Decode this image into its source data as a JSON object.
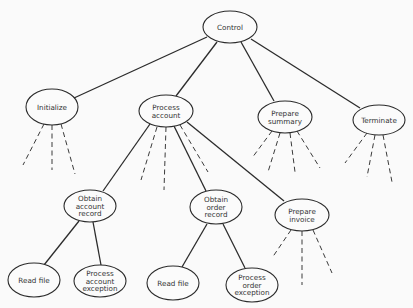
{
  "diagram": {
    "nodes": [
      {
        "id": "control",
        "lines": [
          "Control"
        ],
        "cx": 230,
        "cy": 27,
        "rx": 27,
        "ry": 16
      },
      {
        "id": "initialize",
        "lines": [
          "Initialize"
        ],
        "cx": 52,
        "cy": 107,
        "rx": 26,
        "ry": 18
      },
      {
        "id": "process-account",
        "lines": [
          "Process",
          "account"
        ],
        "cx": 166,
        "cy": 111,
        "rx": 27,
        "ry": 16
      },
      {
        "id": "prepare-summary",
        "lines": [
          "Prepare",
          "summary"
        ],
        "cx": 285,
        "cy": 117,
        "rx": 27,
        "ry": 16
      },
      {
        "id": "terminate",
        "lines": [
          "Terminate"
        ],
        "cx": 379,
        "cy": 120,
        "rx": 26,
        "ry": 15
      },
      {
        "id": "obtain-account-record",
        "lines": [
          "Obtain",
          "account",
          "record"
        ],
        "cx": 90,
        "cy": 206,
        "rx": 26,
        "ry": 16
      },
      {
        "id": "obtain-order-record",
        "lines": [
          "Obtain",
          "order",
          "record"
        ],
        "cx": 216,
        "cy": 207,
        "rx": 26,
        "ry": 17
      },
      {
        "id": "prepare-invoice",
        "lines": [
          "Prepare",
          "invoice"
        ],
        "cx": 302,
        "cy": 215,
        "rx": 27,
        "ry": 16
      },
      {
        "id": "read-file-1",
        "lines": [
          "Read file"
        ],
        "cx": 34,
        "cy": 280,
        "rx": 26,
        "ry": 17
      },
      {
        "id": "process-account-exception",
        "lines": [
          "Process",
          "account",
          "exception"
        ],
        "cx": 100,
        "cy": 281,
        "rx": 26,
        "ry": 16
      },
      {
        "id": "read-file-2",
        "lines": [
          "Read file"
        ],
        "cx": 173,
        "cy": 283,
        "rx": 26,
        "ry": 17
      },
      {
        "id": "process-order-exception",
        "lines": [
          "Process",
          "order",
          "exception"
        ],
        "cx": 252,
        "cy": 285,
        "rx": 26,
        "ry": 17
      }
    ],
    "edges": [
      {
        "from": "control",
        "to": "initialize",
        "style": "solid",
        "x1": 207,
        "y1": 37,
        "x2": 74,
        "y2": 98
      },
      {
        "from": "control",
        "to": "process-account",
        "style": "solid",
        "x1": 217,
        "y1": 42,
        "x2": 176,
        "y2": 96
      },
      {
        "from": "control",
        "to": "prepare-summary",
        "style": "solid",
        "x1": 241,
        "y1": 42,
        "x2": 274,
        "y2": 101
      },
      {
        "from": "control",
        "to": "terminate",
        "style": "solid",
        "x1": 251,
        "y1": 39,
        "x2": 360,
        "y2": 108
      },
      {
        "from": "process-account",
        "to": "obtain-account-record",
        "style": "solid",
        "x1": 150,
        "y1": 124,
        "x2": 103,
        "y2": 191
      },
      {
        "from": "process-account",
        "to": "obtain-order-record",
        "style": "solid",
        "x1": 174,
        "y1": 126,
        "x2": 206,
        "y2": 191
      },
      {
        "from": "process-account",
        "to": "prepare-invoice",
        "style": "solid",
        "x1": 187,
        "y1": 122,
        "x2": 284,
        "y2": 201
      },
      {
        "from": "obtain-account-record",
        "to": "read-file-1",
        "style": "solid",
        "x1": 79,
        "y1": 221,
        "x2": 44,
        "y2": 265
      },
      {
        "from": "obtain-account-record",
        "to": "process-account-exception",
        "style": "solid",
        "x1": 93,
        "y1": 222,
        "x2": 101,
        "y2": 265
      },
      {
        "from": "obtain-order-record",
        "to": "read-file-2",
        "style": "solid",
        "x1": 207,
        "y1": 224,
        "x2": 182,
        "y2": 267
      },
      {
        "from": "obtain-order-record",
        "to": "process-order-exception",
        "style": "solid",
        "x1": 223,
        "y1": 224,
        "x2": 245,
        "y2": 268
      },
      {
        "from": "initialize",
        "to": "",
        "style": "dashed",
        "x1": 44,
        "y1": 124,
        "x2": 23,
        "y2": 165
      },
      {
        "from": "initialize",
        "to": "",
        "style": "dashed",
        "x1": 52,
        "y1": 125,
        "x2": 52,
        "y2": 170
      },
      {
        "from": "initialize",
        "to": "",
        "style": "dashed",
        "x1": 61,
        "y1": 124,
        "x2": 75,
        "y2": 174
      },
      {
        "from": "process-account",
        "to": "",
        "style": "dashed",
        "x1": 157,
        "y1": 127,
        "x2": 141,
        "y2": 180
      },
      {
        "from": "process-account",
        "to": "",
        "style": "dashed",
        "x1": 166,
        "y1": 127,
        "x2": 164,
        "y2": 190
      },
      {
        "from": "process-account",
        "to": "",
        "style": "dashed",
        "x1": 180,
        "y1": 125,
        "x2": 208,
        "y2": 172
      },
      {
        "from": "prepare-summary",
        "to": "",
        "style": "dashed",
        "x1": 272,
        "y1": 131,
        "x2": 252,
        "y2": 158
      },
      {
        "from": "prepare-summary",
        "to": "",
        "style": "dashed",
        "x1": 280,
        "y1": 133,
        "x2": 268,
        "y2": 172
      },
      {
        "from": "prepare-summary",
        "to": "",
        "style": "dashed",
        "x1": 290,
        "y1": 133,
        "x2": 295,
        "y2": 172
      },
      {
        "from": "prepare-summary",
        "to": "",
        "style": "dashed",
        "x1": 297,
        "y1": 131,
        "x2": 320,
        "y2": 168
      },
      {
        "from": "terminate",
        "to": "",
        "style": "dashed",
        "x1": 367,
        "y1": 133,
        "x2": 345,
        "y2": 163
      },
      {
        "from": "terminate",
        "to": "",
        "style": "dashed",
        "x1": 375,
        "y1": 135,
        "x2": 367,
        "y2": 177
      },
      {
        "from": "terminate",
        "to": "",
        "style": "dashed",
        "x1": 383,
        "y1": 135,
        "x2": 392,
        "y2": 182
      },
      {
        "from": "prepare-invoice",
        "to": "",
        "style": "dashed",
        "x1": 291,
        "y1": 230,
        "x2": 272,
        "y2": 258
      },
      {
        "from": "prepare-invoice",
        "to": "",
        "style": "dashed",
        "x1": 302,
        "y1": 231,
        "x2": 302,
        "y2": 285
      },
      {
        "from": "prepare-invoice",
        "to": "",
        "style": "dashed",
        "x1": 313,
        "y1": 230,
        "x2": 332,
        "y2": 273
      }
    ],
    "colors": {
      "background": "#fafafa",
      "stroke": "#2b2b2b",
      "text": "#333333"
    }
  }
}
